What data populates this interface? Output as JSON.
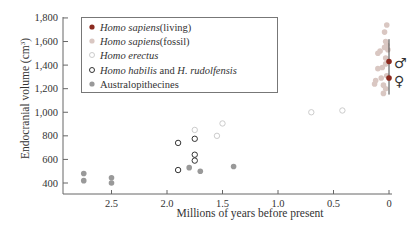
{
  "chart_data": {
    "type": "scatter",
    "title": "",
    "xlabel": "Millions of years before present",
    "ylabel": "Endocranial volume (cm³)",
    "ylabel_main": "Endocranial volume (cm",
    "ylabel_sup": "3",
    "ylabel_end": ")",
    "xlim": [
      2.85,
      0
    ],
    "ylim": [
      300,
      1800
    ],
    "x_reversed": true,
    "grid": false,
    "legend_position": "upper-left",
    "x_ticks": [
      2.5,
      2.0,
      1.5,
      1.0,
      0.5,
      0
    ],
    "x_tick_labels": [
      "2.5",
      "2.0",
      "1.5",
      "1.0",
      "0.5",
      "0"
    ],
    "y_ticks": [
      400,
      600,
      800,
      1000,
      1200,
      1400,
      1600,
      1800
    ],
    "y_tick_labels": [
      "400",
      "600",
      "800",
      "1,000",
      "1,200",
      "1,400",
      "1,600",
      "1,800"
    ],
    "series": [
      {
        "name": "Homo sapiens (living)",
        "name_italic": "Homo sapiens",
        "name_rest": " (living)",
        "marker": "filled-circle",
        "color": "#8b2a1f",
        "points": [
          [
            0.0,
            1430
          ],
          [
            0.0,
            1290
          ]
        ],
        "range_bar": [
          1150,
          1620
        ]
      },
      {
        "name": "Homo sapiens (fossil)",
        "name_italic": "Homo sapiens",
        "name_rest": " (fossil)",
        "marker": "filled-circle",
        "color": "#d9c7c2",
        "points": [
          [
            0.02,
            1740
          ],
          [
            0.04,
            1680
          ],
          [
            0.03,
            1600
          ],
          [
            0.02,
            1570
          ],
          [
            0.04,
            1550
          ],
          [
            0.01,
            1530
          ],
          [
            0.08,
            1520
          ],
          [
            0.1,
            1500
          ],
          [
            0.03,
            1460
          ],
          [
            0.03,
            1410
          ],
          [
            0.06,
            1380
          ],
          [
            0.1,
            1370
          ],
          [
            0.02,
            1310
          ],
          [
            0.07,
            1290
          ],
          [
            0.12,
            1270
          ],
          [
            0.13,
            1240
          ],
          [
            0.05,
            1230
          ],
          [
            0.03,
            1200
          ],
          [
            0.05,
            1160
          ]
        ]
      },
      {
        "name": "Homo erectus",
        "name_italic": "Homo erectus",
        "name_rest": "",
        "marker": "open-circle",
        "color": "#cccccc",
        "points": [
          [
            0.7,
            1000
          ],
          [
            0.42,
            1015
          ],
          [
            1.75,
            850
          ],
          [
            1.5,
            905
          ],
          [
            1.55,
            800
          ]
        ]
      },
      {
        "name": "Homo habilis and H. rudolfensis",
        "name_italic": "Homo habilis",
        "name_mid": " and ",
        "name_italic2": "H. rudolfensis",
        "name_rest": "",
        "marker": "open-circle",
        "color": "#333333",
        "points": [
          [
            1.9,
            740
          ],
          [
            1.75,
            775
          ],
          [
            1.75,
            640
          ],
          [
            1.75,
            590
          ],
          [
            1.9,
            510
          ]
        ]
      },
      {
        "name": "Australopithecines",
        "name_italic": "",
        "name_rest": "Australopithecines",
        "marker": "filled-circle",
        "color": "#999999",
        "points": [
          [
            2.75,
            480
          ],
          [
            2.75,
            420
          ],
          [
            2.5,
            445
          ],
          [
            2.5,
            400
          ],
          [
            1.8,
            530
          ],
          [
            1.7,
            500
          ],
          [
            1.4,
            540
          ]
        ]
      }
    ],
    "annotations": [
      "♂",
      "♀"
    ]
  }
}
